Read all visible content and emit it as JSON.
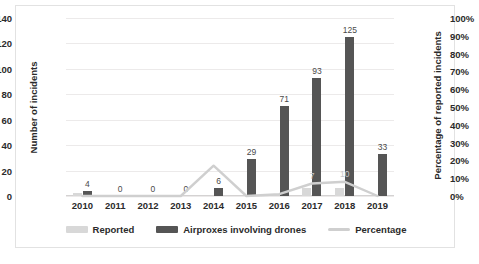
{
  "chart_data": {
    "type": "bar",
    "title": "",
    "xlabel": "",
    "ylabel": "Number of incidents",
    "y2label": "Percentage of reported incidents",
    "categories": [
      "2010",
      "2011",
      "2012",
      "2013",
      "2014",
      "2015",
      "2016",
      "2017",
      "2018",
      "2019"
    ],
    "ylim": [
      0,
      140
    ],
    "yticks": [
      "0",
      "20",
      "40",
      "60",
      "80",
      "100",
      "120",
      "140"
    ],
    "y2lim": [
      0,
      100
    ],
    "y2ticks": [
      "0%",
      "10%",
      "20%",
      "30%",
      "40%",
      "50%",
      "60%",
      "70%",
      "80%",
      "90%",
      "100%"
    ],
    "grid": true,
    "legend_position": "bottom",
    "series": [
      {
        "name": "Reported",
        "type": "bar",
        "axis": "left",
        "color": "#d8d8d8",
        "values": [
          2,
          0,
          0,
          0,
          0,
          0,
          0,
          6,
          6,
          0
        ],
        "labels": [
          "",
          "",
          "",
          "",
          "",
          "",
          "",
          "",
          "",
          ""
        ]
      },
      {
        "name": "Airproxes involving drones",
        "type": "bar",
        "axis": "left",
        "color": "#555555",
        "values": [
          4,
          0,
          0,
          0,
          6,
          29,
          71,
          93,
          125,
          33
        ],
        "labels": [
          "4",
          "0",
          "0",
          "0",
          "6",
          "29",
          "71",
          "93",
          "125",
          "33"
        ]
      },
      {
        "name": "Percentage",
        "type": "line",
        "axis": "right",
        "color": "#cfcfcf",
        "values": [
          0,
          0,
          0,
          0,
          17,
          0,
          1,
          7,
          8,
          0
        ],
        "labels": [
          "",
          "",
          "",
          "",
          "",
          "",
          "",
          "7",
          "10",
          ""
        ]
      }
    ]
  },
  "legend": {
    "items": [
      {
        "label": "Reported",
        "marker": "bar-swatch",
        "color": "#d8d8d8"
      },
      {
        "label": "Airproxes involving drones",
        "marker": "bar-swatch",
        "color": "#555555"
      },
      {
        "label": "Percentage",
        "marker": "line-swatch",
        "color": "#cfcfcf"
      }
    ]
  },
  "caption": {
    "text": ""
  }
}
